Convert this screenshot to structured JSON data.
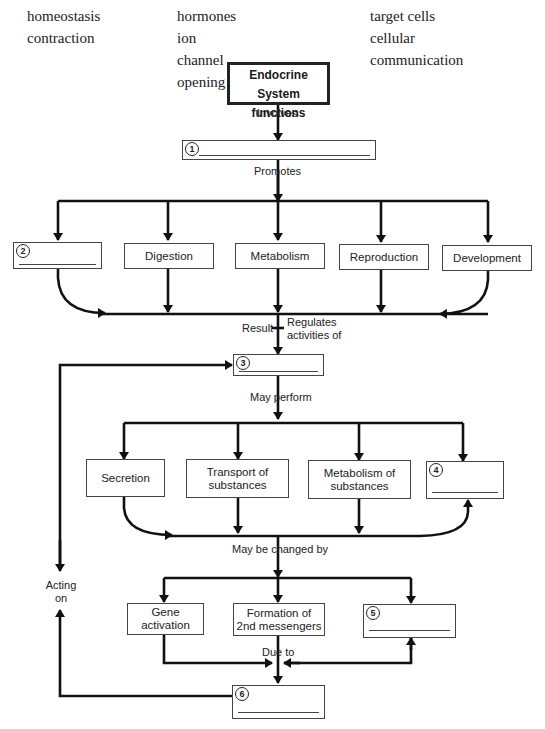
{
  "word_bank": {
    "columns": [
      [
        "homeostasis",
        "contraction"
      ],
      [
        "hormones",
        "ion channel opening"
      ],
      [
        "target cells",
        "cellular communication"
      ]
    ]
  },
  "title": {
    "line1": "Endocrine System",
    "line2": "functions"
  },
  "connectors": {
    "involves": "Involves",
    "promotes": "Promotes",
    "result": "Result",
    "regulates_1": "Regulates",
    "regulates_2": "activities of",
    "may_perform": "May perform",
    "may_be_changed_by": "May be changed by",
    "due_to": "Due to",
    "acting_1": "Acting",
    "acting_2": "on"
  },
  "blanks": [
    {
      "number": "1",
      "answer": ""
    },
    {
      "number": "2",
      "answer": ""
    },
    {
      "number": "3",
      "answer": ""
    },
    {
      "number": "4",
      "answer": ""
    },
    {
      "number": "5",
      "answer": ""
    },
    {
      "number": "6",
      "answer": ""
    }
  ],
  "promotes_row": [
    "Digestion",
    "Metabolism",
    "Reproduction",
    "Development"
  ],
  "perform_row": [
    [
      "Secretion"
    ],
    [
      "Transport of",
      "substances"
    ],
    [
      "Metabolism of",
      "substances"
    ]
  ],
  "changed_row": [
    [
      "Gene",
      "activation"
    ],
    [
      "Formation of",
      "2nd messengers"
    ]
  ]
}
